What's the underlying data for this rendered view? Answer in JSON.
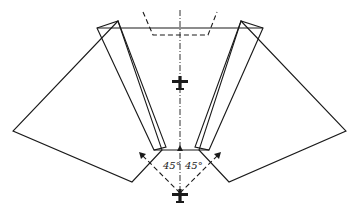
{
  "diagram": {
    "angle_labels": {
      "left": "45°",
      "right": "45°"
    },
    "icons": {
      "upper_aircraft": "aircraft-icon",
      "lower_aircraft": "aircraft-icon"
    },
    "colors": {
      "line": "#1a1a1a",
      "background": "#ffffff"
    }
  }
}
